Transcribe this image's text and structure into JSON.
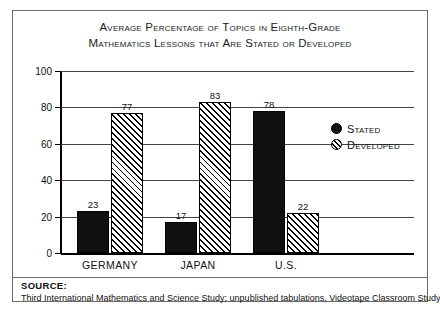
{
  "chart_data": {
    "type": "bar",
    "title": "Average Percentage of Topics in Eighth-Grade Mathematics Lessons that Are Stated or Developed",
    "title_lines": [
      "Average Percentage of Topics in Eighth-Grade",
      "Mathematics Lessons that Are Stated or Developed"
    ],
    "categories": [
      "GERMANY",
      "JAPAN",
      "U.S."
    ],
    "series": [
      {
        "name": "Stated",
        "values": [
          23,
          17,
          78
        ]
      },
      {
        "name": "Developed",
        "values": [
          77,
          83,
          22
        ]
      }
    ],
    "xlabel": "",
    "ylabel": "AVERAGE PERCENT OF TOPICS",
    "ylim": [
      0,
      100
    ],
    "yticks": [
      0,
      20,
      40,
      60,
      80,
      100
    ],
    "ytick_labels": [
      "0",
      "20",
      "40",
      "60",
      "80",
      "100"
    ],
    "grid": true,
    "legend_position": "right",
    "legend": [
      {
        "label": "Stated",
        "marker": "filled-circle"
      },
      {
        "label": "Developed",
        "marker": "hatched-circle"
      }
    ]
  },
  "footer": {
    "source_label": "SOURCE:",
    "source_text": "Third International Mathematics and Science Study; unpublished tabulations, Videotape Classroom Study, UCLA, 1996."
  }
}
